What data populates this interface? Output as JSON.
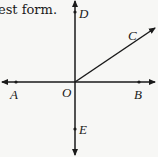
{
  "text_fragment": "est form.",
  "diagram": {
    "origin_label": "O",
    "points": {
      "A": "A",
      "B": "B",
      "C": "C",
      "D": "D",
      "E": "E"
    },
    "colors": {
      "line": "#1a1a1a",
      "background": "#f7f7f5"
    }
  }
}
